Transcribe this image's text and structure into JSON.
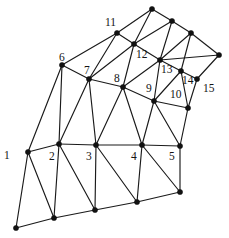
{
  "figure": {
    "width": 229,
    "height": 238,
    "background_color": "#ffffff",
    "edge_color": "#1a1a1a",
    "node_color": "#111111",
    "label_color": "#141414",
    "node_radius": 2.6,
    "edge_width": 1.15
  },
  "chart_data": {
    "type": "diagram",
    "subtype": "triangular-mesh-graph",
    "xlabel": "",
    "ylabel": "",
    "coordinate_system": "image pixels, origin top-left",
    "xlim": [
      0,
      229
    ],
    "ylim": [
      0,
      238
    ],
    "grid": false,
    "legend": null,
    "numbered_node_count": 15,
    "total_node_count": 28,
    "edge_count": 63,
    "nodes": [
      {
        "id": "n1",
        "label": "1",
        "x": 28,
        "y": 152,
        "labeled": true,
        "label_x": 4,
        "label_y": 150
      },
      {
        "id": "n2",
        "label": "2",
        "x": 59,
        "y": 144,
        "labeled": true,
        "label_x": 49,
        "label_y": 151
      },
      {
        "id": "n3",
        "label": "3",
        "x": 96,
        "y": 145,
        "labeled": true,
        "label_x": 86,
        "label_y": 151
      },
      {
        "id": "n4",
        "label": "4",
        "x": 142,
        "y": 145,
        "labeled": true,
        "label_x": 131,
        "label_y": 151
      },
      {
        "id": "n5",
        "label": "5",
        "x": 180,
        "y": 146,
        "labeled": true,
        "label_x": 169,
        "label_y": 151
      },
      {
        "id": "n6",
        "label": "6",
        "x": 62,
        "y": 65,
        "labeled": true,
        "label_x": 59,
        "label_y": 52
      },
      {
        "id": "n7",
        "label": "7",
        "x": 89,
        "y": 79,
        "labeled": true,
        "label_x": 84,
        "label_y": 65
      },
      {
        "id": "n8",
        "label": "8",
        "x": 123,
        "y": 87,
        "labeled": true,
        "label_x": 114,
        "label_y": 73
      },
      {
        "id": "n9",
        "label": "9",
        "x": 154,
        "y": 101,
        "labeled": true,
        "label_x": 146,
        "label_y": 83
      },
      {
        "id": "n10",
        "label": "10",
        "x": 188,
        "y": 108,
        "labeled": true,
        "label_x": 170,
        "label_y": 89
      },
      {
        "id": "n11",
        "label": "11",
        "x": 117,
        "y": 33,
        "labeled": true,
        "label_x": 105,
        "label_y": 17
      },
      {
        "id": "n12",
        "label": "12",
        "x": 134,
        "y": 44,
        "labeled": true,
        "label_x": 136,
        "label_y": 49
      },
      {
        "id": "n13",
        "label": "13",
        "x": 160,
        "y": 60,
        "labeled": true,
        "label_x": 161,
        "label_y": 64
      },
      {
        "id": "n14",
        "label": "14",
        "x": 181,
        "y": 71,
        "labeled": true,
        "label_x": 182,
        "label_y": 75
      },
      {
        "id": "n15",
        "label": "15",
        "x": 197,
        "y": 79,
        "labeled": true,
        "label_x": 203,
        "label_y": 83
      },
      {
        "id": "t1",
        "label": "",
        "x": 152,
        "y": 9,
        "labeled": false
      },
      {
        "id": "t2",
        "label": "",
        "x": 172,
        "y": 21,
        "labeled": false
      },
      {
        "id": "t3",
        "label": "",
        "x": 191,
        "y": 33,
        "labeled": false
      },
      {
        "id": "t4",
        "label": "",
        "x": 219,
        "y": 55,
        "labeled": false
      },
      {
        "id": "b1",
        "label": "",
        "x": 16,
        "y": 228,
        "labeled": false
      },
      {
        "id": "b2",
        "label": "",
        "x": 54,
        "y": 218,
        "labeled": false
      },
      {
        "id": "b3",
        "label": "",
        "x": 95,
        "y": 210,
        "labeled": false
      },
      {
        "id": "b4",
        "label": "",
        "x": 137,
        "y": 202,
        "labeled": false
      },
      {
        "id": "b5",
        "label": "",
        "x": 180,
        "y": 192,
        "labeled": false
      }
    ],
    "edges": [
      [
        "n1",
        "n2"
      ],
      [
        "n2",
        "n3"
      ],
      [
        "n3",
        "n4"
      ],
      [
        "n4",
        "n5"
      ],
      [
        "n1",
        "n6"
      ],
      [
        "n2",
        "n6"
      ],
      [
        "n2",
        "n7"
      ],
      [
        "n3",
        "n7"
      ],
      [
        "n3",
        "n8"
      ],
      [
        "n4",
        "n8"
      ],
      [
        "n4",
        "n9"
      ],
      [
        "n5",
        "n9"
      ],
      [
        "n5",
        "n10"
      ],
      [
        "n6",
        "n7"
      ],
      [
        "n7",
        "n8"
      ],
      [
        "n8",
        "n9"
      ],
      [
        "n9",
        "n10"
      ],
      [
        "n6",
        "n11"
      ],
      [
        "n7",
        "n11"
      ],
      [
        "n7",
        "n12"
      ],
      [
        "n8",
        "n12"
      ],
      [
        "n8",
        "n13"
      ],
      [
        "n9",
        "n13"
      ],
      [
        "n9",
        "n14"
      ],
      [
        "n10",
        "n14"
      ],
      [
        "n11",
        "n12"
      ],
      [
        "n12",
        "n13"
      ],
      [
        "n13",
        "n14"
      ],
      [
        "n14",
        "n15"
      ],
      [
        "n10",
        "n15"
      ],
      [
        "n11",
        "t1"
      ],
      [
        "n12",
        "t1"
      ],
      [
        "n12",
        "t2"
      ],
      [
        "n13",
        "t2"
      ],
      [
        "n13",
        "t3"
      ],
      [
        "n14",
        "t3"
      ],
      [
        "n13",
        "t4"
      ],
      [
        "n15",
        "t4"
      ],
      [
        "t1",
        "t2"
      ],
      [
        "t2",
        "t3"
      ],
      [
        "t3",
        "t4"
      ],
      [
        "n1",
        "b1"
      ],
      [
        "n1",
        "b2"
      ],
      [
        "n2",
        "b2"
      ],
      [
        "n2",
        "b3"
      ],
      [
        "n3",
        "b3"
      ],
      [
        "n3",
        "b4"
      ],
      [
        "n4",
        "b4"
      ],
      [
        "n4",
        "b5"
      ],
      [
        "n5",
        "b5"
      ],
      [
        "b1",
        "b2"
      ],
      [
        "b2",
        "b3"
      ],
      [
        "b3",
        "b4"
      ],
      [
        "b4",
        "b5"
      ]
    ],
    "node_labels_visible": [
      "1",
      "2",
      "3",
      "4",
      "5",
      "6",
      "7",
      "8",
      "9",
      "10",
      "11",
      "12",
      "13",
      "14",
      "15"
    ]
  }
}
